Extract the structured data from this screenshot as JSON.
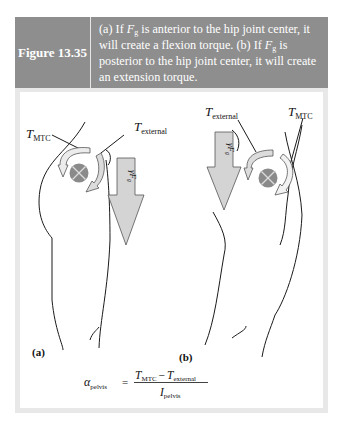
{
  "figure": {
    "number_label": "Figure 13.35",
    "caption": {
      "part_a_prefix": "(a) If ",
      "force_symbol": "F",
      "force_subscript": "g",
      "part_a_suffix": " is anterior to the hip joint center, it will create a flexion torque. (b) If ",
      "part_b_suffix": " is posterior to the hip joint center, it will create an extension torque."
    }
  },
  "diagram_a": {
    "panel_label": "(a)",
    "torque_mtc_label": "T",
    "torque_mtc_subscript": "MTC",
    "torque_external_label": "T",
    "torque_external_subscript": "external",
    "force_arrow_label": "F",
    "force_arrow_prefix": "γ",
    "force_arrow_subscript": "g"
  },
  "diagram_b": {
    "panel_label": "(b)",
    "torque_mtc_label": "T",
    "torque_mtc_subscript": "MTC",
    "torque_external_label": "T",
    "torque_external_subscript": "external",
    "force_arrow_label": "F",
    "force_arrow_prefix": "γ",
    "force_arrow_subscript": "g"
  },
  "equation": {
    "lhs_symbol": "α",
    "lhs_subscript": "pelvis",
    "equals": "=",
    "numerator_t1": "T",
    "numerator_t1_sub": "MTC",
    "minus": "−",
    "numerator_t2": "T",
    "numerator_t2_sub": "external",
    "denominator": "I",
    "denominator_sub": "pelvis"
  },
  "colors": {
    "header_bg": "#8e8e8e",
    "frame_bg": "#e8e8e8",
    "joint_fill": "#8a8a8a",
    "arrow_fill": "#d4d4d4"
  }
}
